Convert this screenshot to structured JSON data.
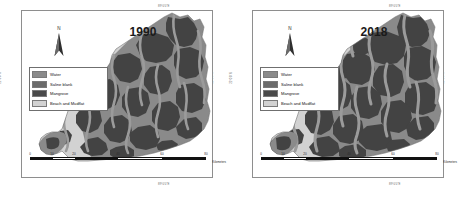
{
  "figure": {
    "type": "land-cover-change-map",
    "panel_count": 2
  },
  "panels": [
    {
      "id": "panel-1990",
      "year_label": "1990",
      "north_label": "N",
      "coords": {
        "top": "89°0'0\"E",
        "bottom": "89°0'0\"E",
        "left": "22°0'0\"N",
        "right": "22°0'0\"N"
      },
      "legend": {
        "items": [
          {
            "label": "Water",
            "color": "#8a8a8a"
          },
          {
            "label": "Saline blank",
            "color": "#6b6b6b"
          },
          {
            "label": "Mangrove",
            "color": "#4a4a4a"
          },
          {
            "label": "Beach and Mudflat",
            "color": "#d2d2d2"
          }
        ]
      },
      "scalebar": {
        "ticks": [
          "0",
          "10",
          "20",
          "40",
          "60",
          "80"
        ],
        "units": "Kilometers"
      }
    },
    {
      "id": "panel-2018",
      "year_label": "2018",
      "north_label": "N",
      "coords": {
        "top": "89°0'0\"E",
        "bottom": "89°0'0\"E",
        "left": "22°0'0\"N",
        "right": "22°0'0\"N"
      },
      "legend": {
        "items": [
          {
            "label": "Water",
            "color": "#8a8a8a"
          },
          {
            "label": "Saline blank",
            "color": "#6b6b6b"
          },
          {
            "label": "Mangrove",
            "color": "#4a4a4a"
          },
          {
            "label": "Beach and Mudflat",
            "color": "#d2d2d2"
          }
        ]
      },
      "scalebar": {
        "ticks": [
          "0",
          "10",
          "20",
          "40",
          "60",
          "80"
        ],
        "units": "Kilometers"
      }
    }
  ],
  "colors": {
    "water": "#8a8a8a",
    "saline_blank": "#6b6b6b",
    "mangrove": "#4a4a4a",
    "beach_mudflat": "#d2d2d2",
    "frame": "#8e8e8e",
    "background": "#ffffff"
  }
}
